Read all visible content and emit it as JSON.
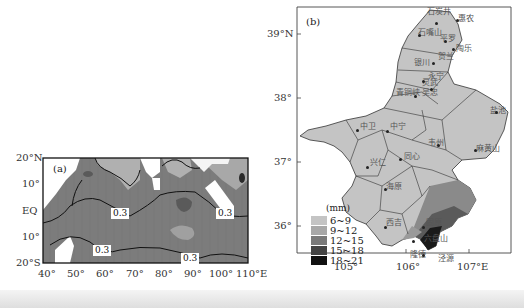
{
  "figure": {
    "panel_a": {
      "label": "(a)",
      "y_ticks": [
        "20°N",
        "10°",
        "EQ",
        "10°",
        "20°S"
      ],
      "x_ticks": [
        "40°",
        "50°",
        "60°",
        "70°",
        "80°",
        "90°",
        "100°",
        "110°E"
      ],
      "contour_labels": [
        "0.3",
        "0.3",
        "0.3",
        "0.3"
      ],
      "colors": {
        "land": "#ffffff",
        "light": "#b4b4b4",
        "mid": "#7c7c7c",
        "dark": "#5a5a5a",
        "darkest": "#2a2a2a"
      }
    },
    "panel_b": {
      "label": "(b)",
      "y_ticks": [
        "39°N",
        "38°",
        "37°",
        "36°"
      ],
      "x_ticks": [
        "105°",
        "106°",
        "107°E"
      ],
      "stations": [
        "石炭井",
        "惠农",
        "石嘴山",
        "平罗",
        "陶乐",
        "贺兰",
        "银川",
        "永宁",
        "灵武",
        "青铜峡",
        "吴忠",
        "盐池",
        "中卫",
        "中宁",
        "同心",
        "韦州",
        "麻黄山",
        "兴仁",
        "海原",
        "西吉",
        "固原",
        "六盘山",
        "隆德",
        "泾源"
      ],
      "legend": {
        "title": "(mm)",
        "items": [
          {
            "label": "6~9",
            "color": "#c4c4c4"
          },
          {
            "label": "9~12",
            "color": "#a8a8a8"
          },
          {
            "label": "12~15",
            "color": "#7a7a7a"
          },
          {
            "label": "15~18",
            "color": "#444444"
          },
          {
            "label": "18~21",
            "color": "#111111"
          }
        ]
      },
      "colors": {
        "region_fill": "#c4c4c4",
        "border": "#333333"
      }
    }
  }
}
